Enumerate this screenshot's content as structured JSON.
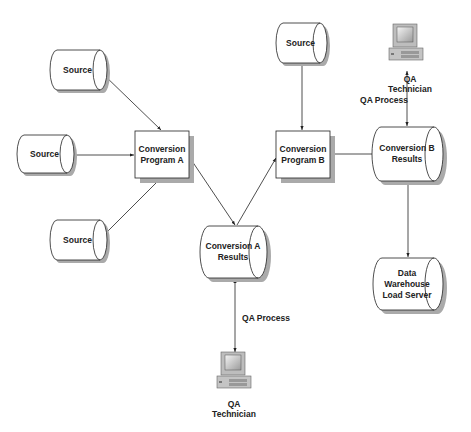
{
  "diagram": {
    "nodes": {
      "source_1": {
        "label": "Source",
        "shape": "cylinder"
      },
      "source_2": {
        "label": "Source",
        "shape": "cylinder"
      },
      "source_3": {
        "label": "Source",
        "shape": "cylinder"
      },
      "source_4": {
        "label": "Source",
        "shape": "cylinder"
      },
      "conversion_program_a": {
        "label": "Conversion\nProgram  A",
        "shape": "box"
      },
      "conversion_program_b": {
        "label": "Conversion\nProgram  B",
        "shape": "box"
      },
      "conversion_a_results": {
        "label": "Conversion A\nResults",
        "shape": "cylinder"
      },
      "conversion_b_results": {
        "label": "Conversion B\nResults",
        "shape": "cylinder"
      },
      "data_warehouse": {
        "label": "Data\nWarehouse\nLoad Server",
        "shape": "cylinder"
      },
      "qa_technician_top": {
        "label": "QA\nTechnician",
        "icon": "computer-icon"
      },
      "qa_technician_bottom": {
        "label": "QA\nTechnician",
        "icon": "computer-icon"
      }
    },
    "edge_labels": {
      "qa_process_top": "QA Process",
      "qa_process_bottom": "QA Process"
    },
    "edges": [
      {
        "from": "source_1",
        "to": "conversion_program_a"
      },
      {
        "from": "source_2",
        "to": "conversion_program_a"
      },
      {
        "from": "source_3",
        "to": "conversion_program_a"
      },
      {
        "from": "conversion_program_a",
        "to": "conversion_a_results"
      },
      {
        "from": "conversion_a_results",
        "to": "conversion_program_b"
      },
      {
        "from": "source_4",
        "to": "conversion_program_b"
      },
      {
        "from": "conversion_program_b",
        "to": "conversion_b_results"
      },
      {
        "from": "conversion_b_results",
        "to": "data_warehouse"
      },
      {
        "from": "qa_technician_top",
        "to": "conversion_b_results",
        "bidirectional": true,
        "label": "QA Process"
      },
      {
        "from": "qa_technician_bottom",
        "to": "conversion_a_results",
        "bidirectional": true,
        "label": "QA Process"
      }
    ],
    "colors": {
      "line": "#222222",
      "shadow": "#a8a8a8",
      "fill": "#ffffff"
    }
  }
}
